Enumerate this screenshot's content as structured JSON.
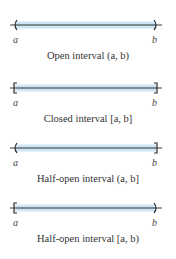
{
  "colors": {
    "fill": "#c9e2f3",
    "axis": "#3a3a3a",
    "bracket": "#2a2a2a"
  },
  "intervals": [
    {
      "left_label": "a",
      "right_label": "b",
      "caption": "Open interval (a, b)",
      "left_end": "(",
      "right_end": ")"
    },
    {
      "left_label": "a",
      "right_label": "b",
      "caption": "Closed interval [a, b]",
      "left_end": "[",
      "right_end": "]"
    },
    {
      "left_label": "a",
      "right_label": "b",
      "caption": "Half-open interval (a, b]",
      "left_end": "(",
      "right_end": "]"
    },
    {
      "left_label": "a",
      "right_label": "b",
      "caption": "Half-open interval [a, b)",
      "left_end": "[",
      "right_end": ")"
    }
  ]
}
